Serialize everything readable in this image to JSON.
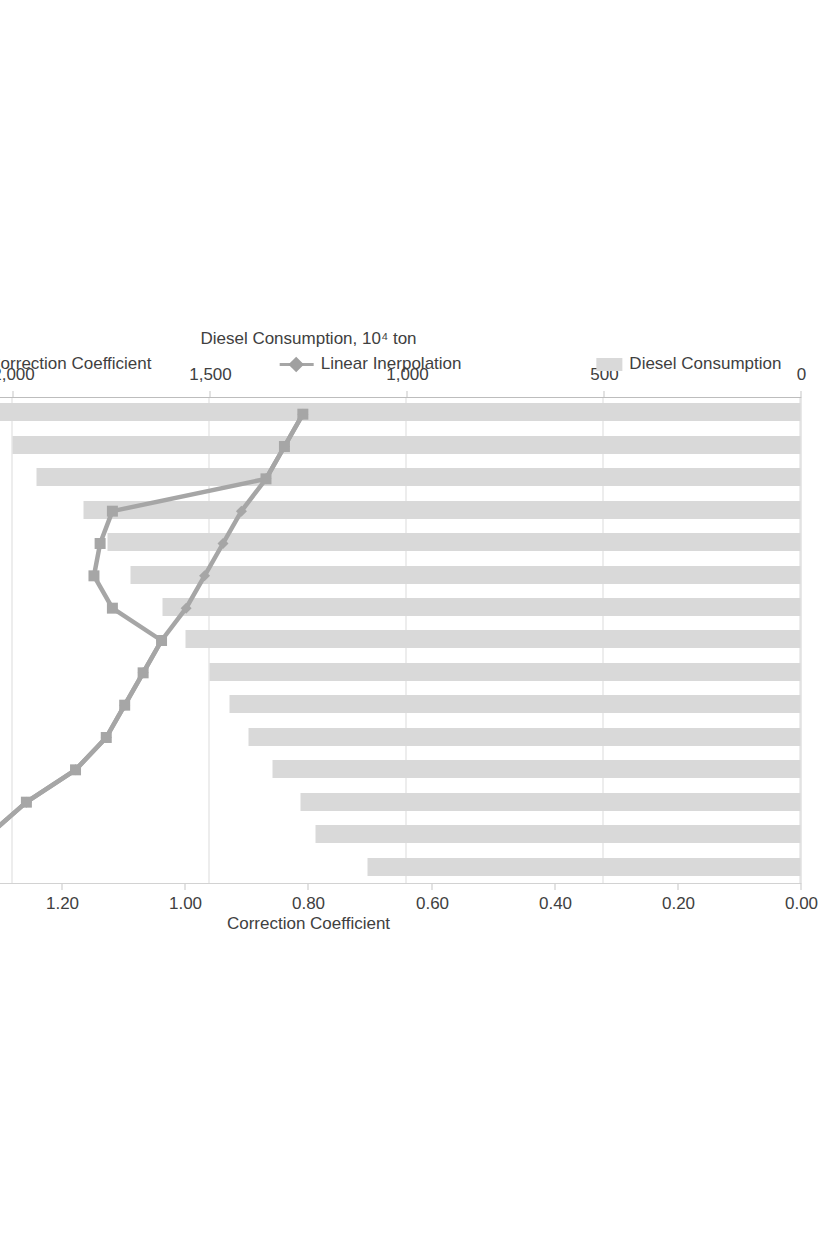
{
  "chart_data": {
    "type": "bar",
    "title": "",
    "orientation": "vertical-bars-displayed-rotated",
    "xlabel": "Year",
    "ylabel": "Diesel Consumption, 10⁴ ton",
    "y2label": "Correction Coefficient",
    "categories": [
      "1996",
      "1997",
      "1998",
      "1999",
      "2000",
      "2001",
      "2002",
      "2003",
      "2004",
      "2005",
      "2006",
      "2007",
      "2008",
      "2009",
      "2010"
    ],
    "ylim": [
      0,
      2500
    ],
    "y2lim": [
      0.0,
      1.6
    ],
    "yticks": [
      "0",
      "500",
      "1,000",
      "1,500",
      "2,000",
      "2,500"
    ],
    "ytick_values": [
      0,
      500,
      1000,
      1500,
      2000,
      2500
    ],
    "y2ticks": [
      "0.00",
      "0.20",
      "0.40",
      "0.60",
      "0.80",
      "1.00",
      "1.20",
      "1.40",
      "1.60"
    ],
    "y2tick_values": [
      0.0,
      0.2,
      0.4,
      0.6,
      0.8,
      1.0,
      1.2,
      1.4,
      1.6
    ],
    "grid": true,
    "legend_position": "bottom",
    "series": [
      {
        "name": "Diesel Consumption",
        "type": "bar",
        "axis": "primary",
        "color": "#d9d9d9",
        "values": [
          1100,
          1230,
          1270,
          1340,
          1400,
          1450,
          1500,
          1560,
          1620,
          1700,
          1760,
          1820,
          1940,
          2000,
          2130
        ]
      },
      {
        "name": "Linear Inerpolation",
        "type": "line",
        "axis": "secondary",
        "color": "#a6a6a6",
        "marker": "diamond",
        "values": [
          1.4,
          1.32,
          1.26,
          1.18,
          1.13,
          1.1,
          1.07,
          1.04,
          1.0,
          0.97,
          0.94,
          0.91,
          0.87,
          0.84,
          0.81
        ]
      },
      {
        "name": "Correction Coefficient",
        "type": "line",
        "axis": "secondary",
        "color": "#a6a6a6",
        "marker": "square",
        "values": [
          1.4,
          1.32,
          1.26,
          1.18,
          1.13,
          1.1,
          1.07,
          1.04,
          1.12,
          1.15,
          1.14,
          1.12,
          0.87,
          0.84,
          0.81
        ]
      }
    ]
  },
  "legend": {
    "items": [
      {
        "label": "Diesel Consumption",
        "marker": "bar-swatch"
      },
      {
        "label": "Linear Inerpolation",
        "marker": "line-diamond"
      },
      {
        "label": "Correction Coefficient",
        "marker": "line-square"
      }
    ]
  },
  "axes": {
    "primary_title": "Diesel Consumption, 10⁴ ton",
    "secondary_title": "Correction Coefficient",
    "category_title": "Year"
  }
}
